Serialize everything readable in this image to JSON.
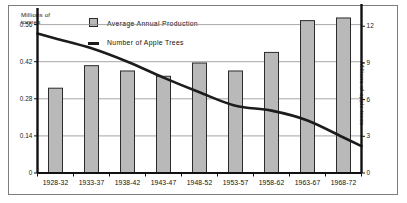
{
  "chart_data": {
    "type": "bar",
    "title": "",
    "categories": [
      "1928-32",
      "1933-37",
      "1938-42",
      "1943-47",
      "1948-52",
      "1953-57",
      "1958-62",
      "1963-67",
      "1968-72"
    ],
    "xlabel": "",
    "ylabel": "Millions of tonnes",
    "ylabel_right": "Millions of apple trees",
    "ylim": [
      0,
      0.6
    ],
    "ylim_right": [
      0,
      13
    ],
    "yticks": [
      0,
      0.14,
      0.28,
      0.42,
      0.56
    ],
    "ytick_labels": [
      "0",
      "0.14",
      "0.28",
      "0.42",
      "0.56"
    ],
    "yticks_right": [
      0,
      3,
      6,
      9,
      12
    ],
    "ytick_labels_right": [
      "0",
      "3",
      "6",
      "9",
      "12"
    ],
    "grid": true,
    "legend_position": "top-center",
    "series": [
      {
        "name": "Average Annual Production",
        "type": "bar",
        "axis": "left",
        "units": "Millions of tonnes",
        "color": "#b9b9b9",
        "edge_color": "#2b2b2b",
        "values": [
          0.32,
          0.405,
          0.385,
          0.365,
          0.415,
          0.385,
          0.455,
          0.575,
          0.585
        ]
      },
      {
        "name": "Number of Apple Trees",
        "type": "line",
        "axis": "right",
        "units": "Millions of apple trees",
        "color": "#1c1c1c",
        "values": [
          11.0,
          10.2,
          9.1,
          7.8,
          6.6,
          5.5,
          5.1,
          4.3,
          2.9
        ]
      }
    ]
  },
  "legend": {
    "bar_label": "Average Annual Production",
    "line_label": "Number of Apple Trees"
  },
  "axes": {
    "left_title_line1": "Millions of",
    "left_title_line2": "tonnes",
    "right_title": "Millions of apple trees"
  }
}
